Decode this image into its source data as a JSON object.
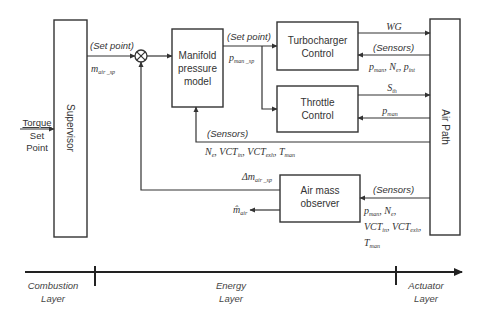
{
  "blocks": {
    "supervisor": "Supervisor",
    "manifold": [
      "Manifold",
      "pressure",
      "model"
    ],
    "turbocharger": [
      "Turbocharger",
      "Control"
    ],
    "throttle": [
      "Throttle",
      "Control"
    ],
    "air_mass_observer": [
      "Air mass",
      "observer"
    ],
    "air_path": "Air Path"
  },
  "inputs": {
    "torque_set_point": [
      "Torque",
      "Set",
      "Point"
    ]
  },
  "signals": {
    "set_point_label": "(Set point)",
    "sensors_label": "(Sensors)",
    "m_air_sp": {
      "base": "m",
      "sub": "air _sp"
    },
    "p_man_sp": {
      "base": "p",
      "sub": "man _sp"
    },
    "wg": "WG",
    "turbo_sensors": "p_man, N_e, p_int",
    "s_th": {
      "base": "S",
      "sub": "th"
    },
    "p_man": {
      "base": "p",
      "sub": "man"
    },
    "manifold_sensors": "N_e, VCT_in, VCT_exh, T_man",
    "delta_m_air_sp": {
      "base": "Δm",
      "sub": "air _sp"
    },
    "m_air_hat": {
      "base": "m̂",
      "sub": "air"
    },
    "observer_sensors": [
      "p_man, N_e,",
      "VCT_in, VCT_exh,",
      "T_man"
    ]
  },
  "layers_axis": {
    "layers": [
      {
        "label": [
          "Combustion",
          "Layer"
        ]
      },
      {
        "label": [
          "Energy",
          "Layer"
        ]
      },
      {
        "label": [
          "Actuator",
          "Layer"
        ]
      }
    ]
  }
}
